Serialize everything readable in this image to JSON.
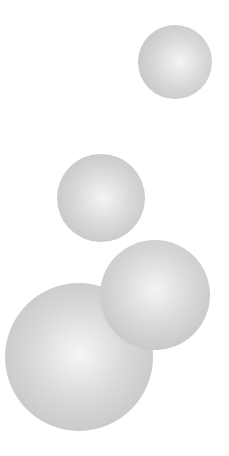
{
  "scene": {
    "width": 229,
    "height": 456,
    "background": "#ffffff",
    "spheres": [
      {
        "name": "sphere-top-right",
        "cx": 175,
        "cy": 62,
        "r": 37,
        "highlight": [
          56,
          50
        ],
        "center_color": "#f4f4f4",
        "edge_color": "#bcbcbc"
      },
      {
        "name": "sphere-middle",
        "cx": 101,
        "cy": 198,
        "r": 44,
        "highlight": [
          52,
          50
        ],
        "center_color": "#f4f4f4",
        "edge_color": "#bcbcbc"
      },
      {
        "name": "sphere-lower-right",
        "cx": 155,
        "cy": 295,
        "r": 55,
        "highlight": [
          50,
          45
        ],
        "center_color": "#f4f4f4",
        "edge_color": "#bcbcbc"
      },
      {
        "name": "sphere-bottom-left",
        "cx": 79,
        "cy": 357,
        "r": 74,
        "highlight": [
          50,
          48
        ],
        "center_color": "#f6f6f6",
        "edge_color": "#bcbcbc"
      }
    ]
  }
}
